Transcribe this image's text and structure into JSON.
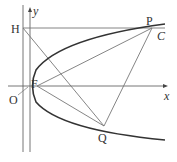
{
  "diagram": {
    "type": "parabola-focus-directrix",
    "labels": {
      "y_axis": "y",
      "x_axis": "x",
      "origin": "O",
      "focus": "F",
      "H": "H",
      "P": "P",
      "Q": "Q",
      "curve": "C"
    },
    "colors": {
      "curve": "#333333",
      "lines": "#777777",
      "text": "#333333"
    }
  }
}
